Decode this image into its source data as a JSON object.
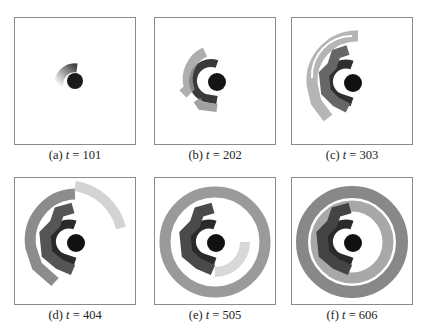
{
  "figure": {
    "panels": [
      {
        "id": "a",
        "label": "(a)",
        "variable": "t",
        "equals": "=",
        "value": "101",
        "stage": 1
      },
      {
        "id": "b",
        "label": "(b)",
        "variable": "t",
        "equals": "=",
        "value": "202",
        "stage": 2
      },
      {
        "id": "c",
        "label": "(c)",
        "variable": "t",
        "equals": "=",
        "value": "303",
        "stage": 3
      },
      {
        "id": "d",
        "label": "(d)",
        "variable": "t",
        "equals": "=",
        "value": "404",
        "stage": 4
      },
      {
        "id": "e",
        "label": "(e)",
        "variable": "t",
        "equals": "=",
        "value": "505",
        "stage": 5
      },
      {
        "id": "f",
        "label": "(f)",
        "variable": "t",
        "equals": "=",
        "value": "606",
        "stage": 6
      }
    ],
    "colors": {
      "frame_border": "#8a8a8a",
      "core": "#111111",
      "inner_ring": "#3a3a3a",
      "mid_ring": "#6a6a6a",
      "outer_ring": "#9a9a9a",
      "faint": "#d0d0d0"
    }
  }
}
